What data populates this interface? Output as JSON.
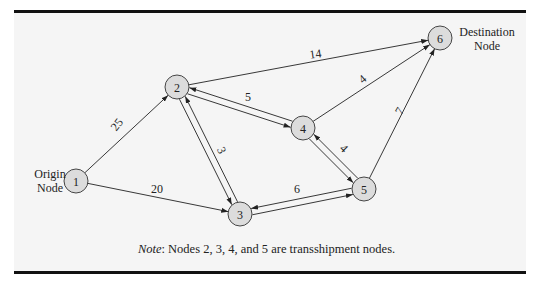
{
  "figure": {
    "nodes": [
      {
        "id": "1",
        "label": "1",
        "x": 76,
        "y": 181
      },
      {
        "id": "2",
        "label": "2",
        "x": 177,
        "y": 87
      },
      {
        "id": "3",
        "label": "3",
        "x": 240,
        "y": 214
      },
      {
        "id": "4",
        "label": "4",
        "x": 303,
        "y": 128
      },
      {
        "id": "5",
        "label": "5",
        "x": 364,
        "y": 189
      },
      {
        "id": "6",
        "label": "6",
        "x": 440,
        "y": 38
      }
    ],
    "node_radius": 12,
    "edges": [
      {
        "from": "1",
        "to": "2",
        "cost": "25",
        "label_x": 120,
        "label_y": 127,
        "label_rot": -52
      },
      {
        "from": "1",
        "to": "3",
        "cost": "20",
        "label_x": 157,
        "label_y": 193,
        "label_rot": 0
      },
      {
        "from": "2",
        "to": "6",
        "cost": "14",
        "label_x": 316,
        "label_y": 58,
        "label_rot": -8
      },
      {
        "from": "2",
        "to": "4",
        "cost": "5",
        "label_x": 248,
        "label_y": 101,
        "label_rot": 0,
        "bidirectional": true
      },
      {
        "from": "2",
        "to": "3",
        "cost": "3",
        "label_x": 218,
        "label_y": 152,
        "label_rot": 65,
        "bidirectional": true
      },
      {
        "from": "4",
        "to": "6",
        "cost": "4",
        "label_x": 365,
        "label_y": 82,
        "label_rot": -40
      },
      {
        "from": "4",
        "to": "5",
        "cost": "4",
        "label_x": 341,
        "label_y": 151,
        "label_rot": 45,
        "bidirectional": true
      },
      {
        "from": "3",
        "to": "5",
        "cost": "6",
        "label_x": 297,
        "label_y": 193,
        "label_rot": 0,
        "bidirectional": true
      },
      {
        "from": "5",
        "to": "6",
        "cost": "7",
        "label_x": 403,
        "label_y": 113,
        "label_rot": -60
      }
    ],
    "origin_label": [
      "Origin",
      "Node"
    ],
    "destination_label": [
      "Destination",
      "Node"
    ],
    "note_prefix": "Note",
    "note_text": ":  Nodes 2, 3, 4, and 5 are transshipment nodes."
  }
}
